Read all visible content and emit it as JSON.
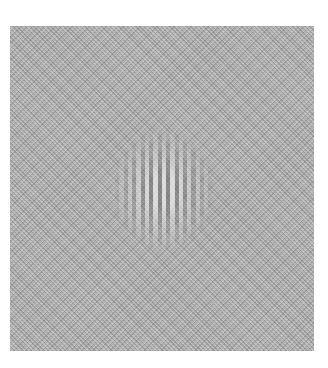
{
  "image": {
    "description": "Gabor patch (vertical sinusoidal grating under Gaussian envelope) embedded in visual noise",
    "background_color": "#ffffff",
    "noise_field": {
      "color": "#b4b4b4",
      "left": 10,
      "top": 26,
      "width": 304,
      "height": 325
    },
    "gabor": {
      "orientation": "vertical",
      "center_x": 163,
      "center_y": 188,
      "period_px": 8.5,
      "visible_bars": 11
    }
  }
}
